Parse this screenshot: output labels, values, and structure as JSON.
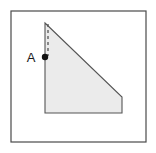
{
  "figure": {
    "type": "geometry-diagram",
    "canvas": {
      "width": 156,
      "height": 153
    },
    "background_color": "#ffffff",
    "frame": {
      "name": "outer-border",
      "x": 11,
      "y": 11,
      "width": 135,
      "height": 131,
      "stroke_color": "#4a4a4a",
      "stroke_width": 1.2,
      "fill": "none"
    },
    "shape": {
      "name": "shaded-right-trapezoid",
      "points": "45,23 122,97 122,113 45,113",
      "fill_color": "#ebebeb",
      "stroke_color": "#555555",
      "stroke_width": 1.1,
      "vertices": [
        {
          "label": "apex",
          "x": 45,
          "y": 23
        },
        {
          "label": "right-upper",
          "x": 122,
          "y": 97
        },
        {
          "label": "right-lower",
          "x": 122,
          "y": 113
        },
        {
          "label": "bottom-left",
          "x": 45,
          "y": 113
        }
      ]
    },
    "dashed_segment": {
      "name": "altitude-dashed-line",
      "x1": 48,
      "y1": 24,
      "x2": 48,
      "y2": 56,
      "stroke_color": "#555555",
      "stroke_width": 1.3,
      "dash_pattern": "3,3"
    },
    "point_marker": {
      "name": "point-a-marker",
      "cx": 45,
      "cy": 57,
      "r": 3.2,
      "fill_color": "#111111"
    },
    "label": {
      "name": "point-a-label",
      "text": "A",
      "x": 31,
      "y": 62,
      "font_size": 13,
      "color": "#1a1a1a"
    }
  }
}
